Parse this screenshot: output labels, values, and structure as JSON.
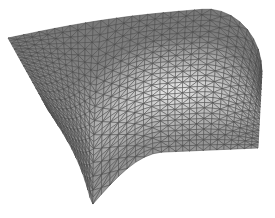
{
  "figure": {
    "background": "#ffffff",
    "mesh": {
      "rows": 26,
      "cols": 34,
      "edge_color": "#4a4a4a",
      "base_fill": "#8c8c8c",
      "highlight_fill": "#d8d8d8",
      "shadow_fill": "#6a6a6a"
    },
    "outline": {
      "top_left": [
        8,
        38
      ],
      "top_right": [
        206,
        9
      ],
      "right_top": [
        262,
        72
      ],
      "right_bottom": [
        258,
        148
      ],
      "bottom_right_inner": [
        165,
        152
      ],
      "bottom_left": [
        92,
        205
      ],
      "left_bottom": [
        48,
        110
      ]
    }
  }
}
